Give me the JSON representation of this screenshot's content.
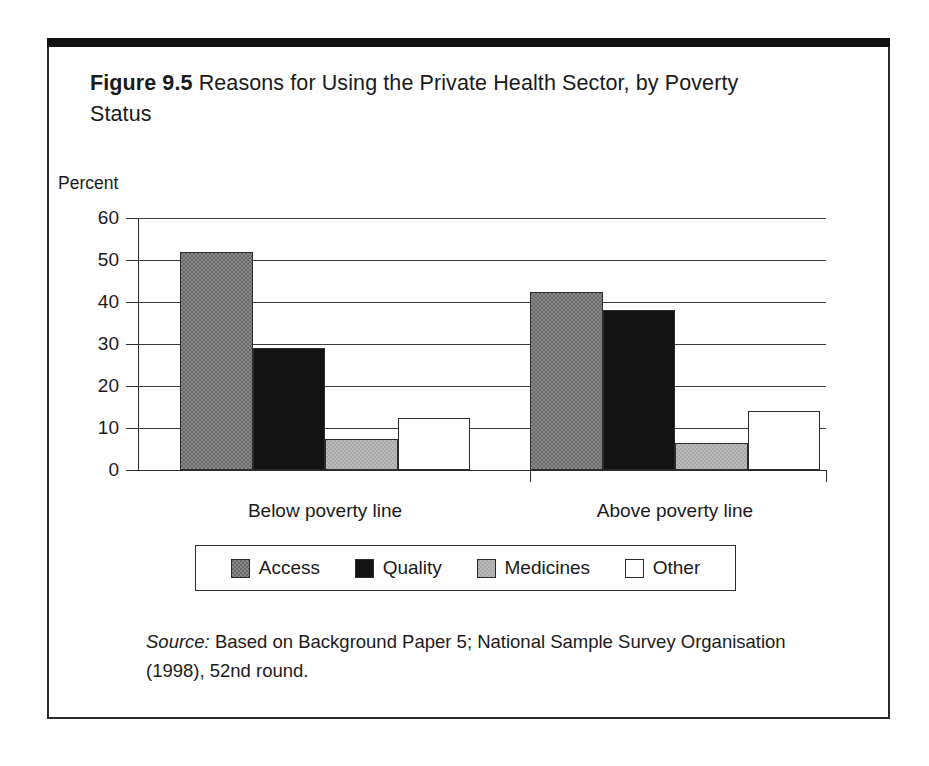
{
  "figure": {
    "label": "Figure 9.5",
    "caption": "Reasons for Using the Private Health Sector, by Poverty Status",
    "source_word": "Source:",
    "source_text": " Based on Background Paper 5; National Sample Survey Organisation (1998), 52nd round."
  },
  "axis": {
    "percent_label": "Percent",
    "ytick_labels": [
      "60",
      "50",
      "40",
      "30",
      "20",
      "10",
      "0"
    ]
  },
  "legend": {
    "items": [
      {
        "label": "Access",
        "color": "#6a6a6a",
        "swatch": "swatch-access"
      },
      {
        "label": "Quality",
        "color": "#131313",
        "swatch": "swatch-quality"
      },
      {
        "label": "Medicines",
        "color": "#a8a8a8",
        "swatch": "swatch-medicines"
      },
      {
        "label": "Other",
        "color": "#ffffff",
        "swatch": "swatch-other"
      }
    ]
  },
  "chart_data": {
    "type": "bar",
    "title": "Figure 9.5 Reasons for Using the Private Health Sector, by Poverty Status",
    "xlabel": "",
    "ylabel": "Percent",
    "ylim": [
      0,
      60
    ],
    "yticks": [
      0,
      10,
      20,
      30,
      40,
      50,
      60
    ],
    "grid": true,
    "legend_position": "bottom",
    "categories": [
      "Below poverty line",
      "Above poverty line"
    ],
    "series": [
      {
        "name": "Access",
        "values": [
          52.0,
          42.5
        ]
      },
      {
        "name": "Quality",
        "values": [
          29.0,
          38.0
        ]
      },
      {
        "name": "Medicines",
        "values": [
          7.5,
          6.5
        ]
      },
      {
        "name": "Other",
        "values": [
          12.5,
          14.0
        ]
      }
    ]
  }
}
